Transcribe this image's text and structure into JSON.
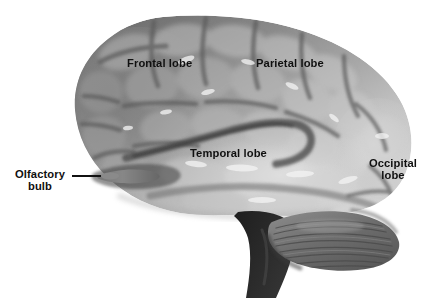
{
  "figure": {
    "view": "lateral",
    "background_color": "#ffffff",
    "width": 432,
    "height": 298,
    "rendering": "grayscale photographic illustration"
  },
  "labels": {
    "frontal": "Frontal lobe",
    "parietal": "Parietal lobe",
    "temporal": "Temporal lobe",
    "occipital_line1": "Occipital",
    "occipital_line2": "lobe",
    "olfactory_line1": "Olfactory",
    "olfactory_line2": "bulb"
  },
  "label_style": {
    "color": "#101010",
    "weight": "bold",
    "size_px": 11
  },
  "leader_lines": [
    {
      "name": "olfactory-bulb-leader",
      "from_label": "Olfactory bulb",
      "color": "#111111",
      "orientation": "horizontal"
    }
  ],
  "anatomy": {
    "regions": [
      "frontal lobe",
      "parietal lobe",
      "temporal lobe",
      "occipital lobe",
      "olfactory bulb",
      "cerebellum",
      "brainstem",
      "lateral sulcus"
    ]
  },
  "palette": {
    "background": "#ffffff",
    "cortex_dark": "#7e7e7e",
    "cortex_mid": "#a6a6a6",
    "cortex_light": "#cfcfcf",
    "highlight": "#e4e4e4",
    "sulcus_shadow": "#5a5a5a",
    "cerebellum": "#6e6e6e",
    "brainstem": "#2a2a2a",
    "outline_shadow": "#6a6a6a"
  }
}
